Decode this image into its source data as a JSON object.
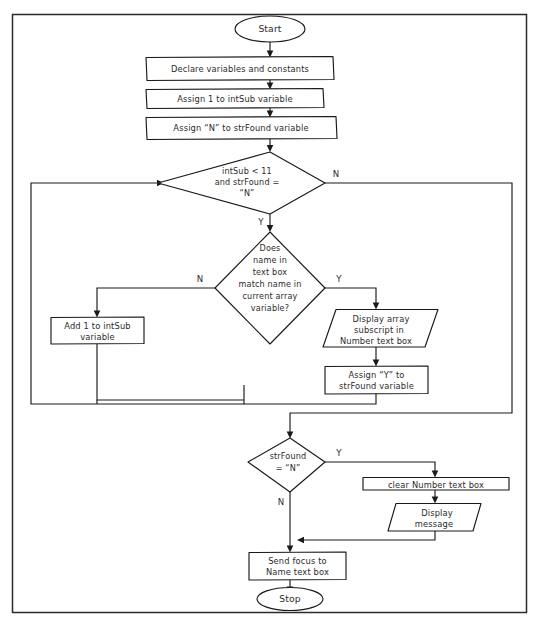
{
  "diagram": {
    "type": "flowchart",
    "nodes": [
      {
        "id": "start",
        "shape": "terminator",
        "lines": [
          "Start"
        ]
      },
      {
        "id": "declare",
        "shape": "process",
        "lines": [
          "Declare variables and constants"
        ]
      },
      {
        "id": "assign_sub",
        "shape": "process",
        "lines": [
          "Assign 1 to intSub variable"
        ]
      },
      {
        "id": "assign_found",
        "shape": "process",
        "lines": [
          "Assign “N” to strFound variable"
        ]
      },
      {
        "id": "loop_test",
        "shape": "decision",
        "lines": [
          "intSub < 11",
          "and strFound =",
          "“N”"
        ]
      },
      {
        "id": "match_test",
        "shape": "decision",
        "lines": [
          "Does",
          "name in",
          "text box",
          "match name in",
          "current array",
          "variable?"
        ]
      },
      {
        "id": "add_sub",
        "shape": "process",
        "lines": [
          "Add 1 to intSub",
          "variable"
        ]
      },
      {
        "id": "display_sub",
        "shape": "parallelogram",
        "lines": [
          "Display array",
          "subscript in",
          "Number text box"
        ]
      },
      {
        "id": "assign_y",
        "shape": "process",
        "lines": [
          "Assign “Y” to",
          "strFound variable"
        ]
      },
      {
        "id": "found_test",
        "shape": "decision",
        "lines": [
          "strFound",
          "= “N”"
        ]
      },
      {
        "id": "clear_number",
        "shape": "process",
        "lines": [
          "clear Number text box"
        ]
      },
      {
        "id": "display_msg",
        "shape": "parallelogram",
        "lines": [
          "Display",
          "message"
        ]
      },
      {
        "id": "send_focus",
        "shape": "process",
        "lines": [
          "Send focus to",
          "Name text box"
        ]
      },
      {
        "id": "stop",
        "shape": "terminator",
        "lines": [
          "Stop"
        ]
      }
    ],
    "branch_labels": {
      "loop_test_no": "N",
      "loop_test_yes": "Y",
      "match_test_no": "N",
      "match_test_yes": "Y",
      "found_test_yes": "Y",
      "found_test_no": "N"
    },
    "colors": {
      "stroke": "#1a1a1a",
      "fill": "#ffffff",
      "frame": "#2a2a2a",
      "text": "#2b2b2b"
    }
  }
}
